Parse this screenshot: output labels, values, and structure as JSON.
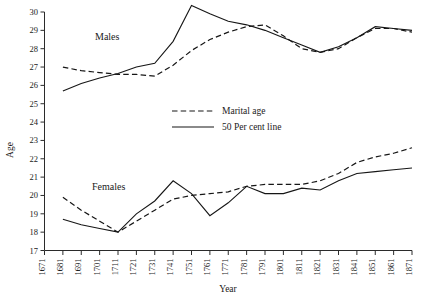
{
  "chart_data": {
    "type": "line",
    "title": "",
    "xlabel": "Year",
    "ylabel": "Age",
    "xlim": [
      1671,
      1871
    ],
    "ylim": [
      17,
      30
    ],
    "grid": false,
    "legend_position": "center",
    "x_tick_labels": [
      "1671",
      "1681",
      "1691",
      "1701",
      "1711",
      "1721",
      "1731",
      "1741",
      "1751",
      "1761",
      "1771",
      "1781",
      "1791",
      "1801",
      "1811",
      "1821",
      "1831",
      "1841",
      "1851",
      "1861",
      "1871"
    ],
    "y_tick_labels": [
      "17",
      "18",
      "19",
      "20",
      "21",
      "22",
      "23",
      "24",
      "25",
      "26",
      "27",
      "28",
      "29",
      "30"
    ],
    "group_labels": [
      {
        "name": "males-label",
        "text": "Males"
      },
      {
        "name": "females-label",
        "text": "Females"
      }
    ],
    "legend": [
      {
        "label": "Marital age",
        "style": "dashed"
      },
      {
        "label": "50 Per cent line",
        "style": "solid"
      }
    ],
    "series": [
      {
        "name": "Males marital age",
        "group": "Males",
        "style": "dashed",
        "x": [
          1681,
          1691,
          1701,
          1711,
          1721,
          1731,
          1741,
          1751,
          1761,
          1771,
          1781,
          1791,
          1801,
          1811,
          1821,
          1831,
          1841,
          1851,
          1861,
          1871
        ],
        "values": [
          27.0,
          26.8,
          26.7,
          26.6,
          26.6,
          26.5,
          27.1,
          27.9,
          28.5,
          28.9,
          29.2,
          29.3,
          28.7,
          28.0,
          27.8,
          28.0,
          28.6,
          29.1,
          29.1,
          28.9
        ]
      },
      {
        "name": "Males 50 per cent line",
        "group": "Males",
        "style": "solid",
        "x": [
          1681,
          1691,
          1701,
          1711,
          1721,
          1731,
          1741,
          1751,
          1761,
          1771,
          1781,
          1791,
          1801,
          1811,
          1821,
          1831,
          1841,
          1851,
          1861,
          1871
        ],
        "values": [
          25.7,
          26.1,
          26.4,
          26.65,
          27.0,
          27.2,
          28.4,
          30.35,
          29.9,
          29.5,
          29.3,
          29.0,
          28.6,
          28.2,
          27.8,
          28.1,
          28.6,
          29.2,
          29.1,
          29.0
        ]
      },
      {
        "name": "Females marital age",
        "group": "Females",
        "style": "dashed",
        "x": [
          1681,
          1691,
          1701,
          1711,
          1721,
          1731,
          1741,
          1751,
          1761,
          1771,
          1781,
          1791,
          1801,
          1811,
          1821,
          1831,
          1841,
          1851,
          1861,
          1871
        ],
        "values": [
          19.9,
          19.2,
          18.6,
          18.0,
          18.6,
          19.2,
          19.8,
          20.0,
          20.1,
          20.2,
          20.5,
          20.6,
          20.6,
          20.6,
          20.8,
          21.2,
          21.8,
          22.1,
          22.3,
          22.6
        ]
      },
      {
        "name": "Females 50 per cent line",
        "group": "Females",
        "style": "solid",
        "x": [
          1681,
          1691,
          1701,
          1711,
          1721,
          1731,
          1741,
          1751,
          1761,
          1771,
          1781,
          1791,
          1801,
          1811,
          1821,
          1831,
          1841,
          1851,
          1861,
          1871
        ],
        "values": [
          18.7,
          18.4,
          18.2,
          18.0,
          19.0,
          19.7,
          20.8,
          20.1,
          18.9,
          19.6,
          20.5,
          20.1,
          20.1,
          20.4,
          20.3,
          20.8,
          21.2,
          21.3,
          21.4,
          21.5
        ]
      }
    ]
  }
}
